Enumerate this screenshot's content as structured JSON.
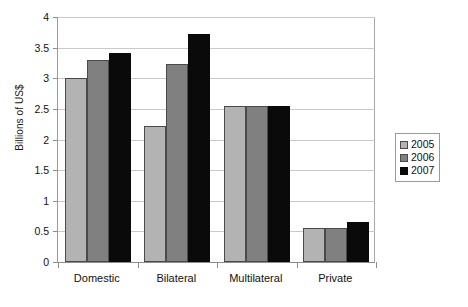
{
  "chart_data": {
    "type": "bar",
    "title": "",
    "xlabel": "",
    "ylabel": "Billions of US$",
    "categories": [
      "Domestic",
      "Bilateral",
      "Multilateral",
      "Private"
    ],
    "series": [
      {
        "name": "2005",
        "color": "#b3b3b3",
        "values": [
          3.0,
          2.22,
          2.55,
          0.55
        ]
      },
      {
        "name": "2006",
        "color": "#808080",
        "values": [
          3.3,
          3.23,
          2.55,
          0.55
        ]
      },
      {
        "name": "2007",
        "color": "#0a0a0a",
        "values": [
          3.42,
          3.73,
          2.55,
          0.65
        ]
      }
    ],
    "ylim": [
      0,
      4
    ],
    "ytick_step": 0.5,
    "ytick_labels": [
      "0",
      "0.5",
      "1",
      "1.5",
      "2",
      "2.5",
      "3",
      "3.5",
      "4"
    ],
    "grid": true,
    "legend_position": "right"
  },
  "legend": {
    "entries": [
      {
        "label": "2005"
      },
      {
        "label": "2006"
      },
      {
        "label": "2007"
      }
    ]
  }
}
